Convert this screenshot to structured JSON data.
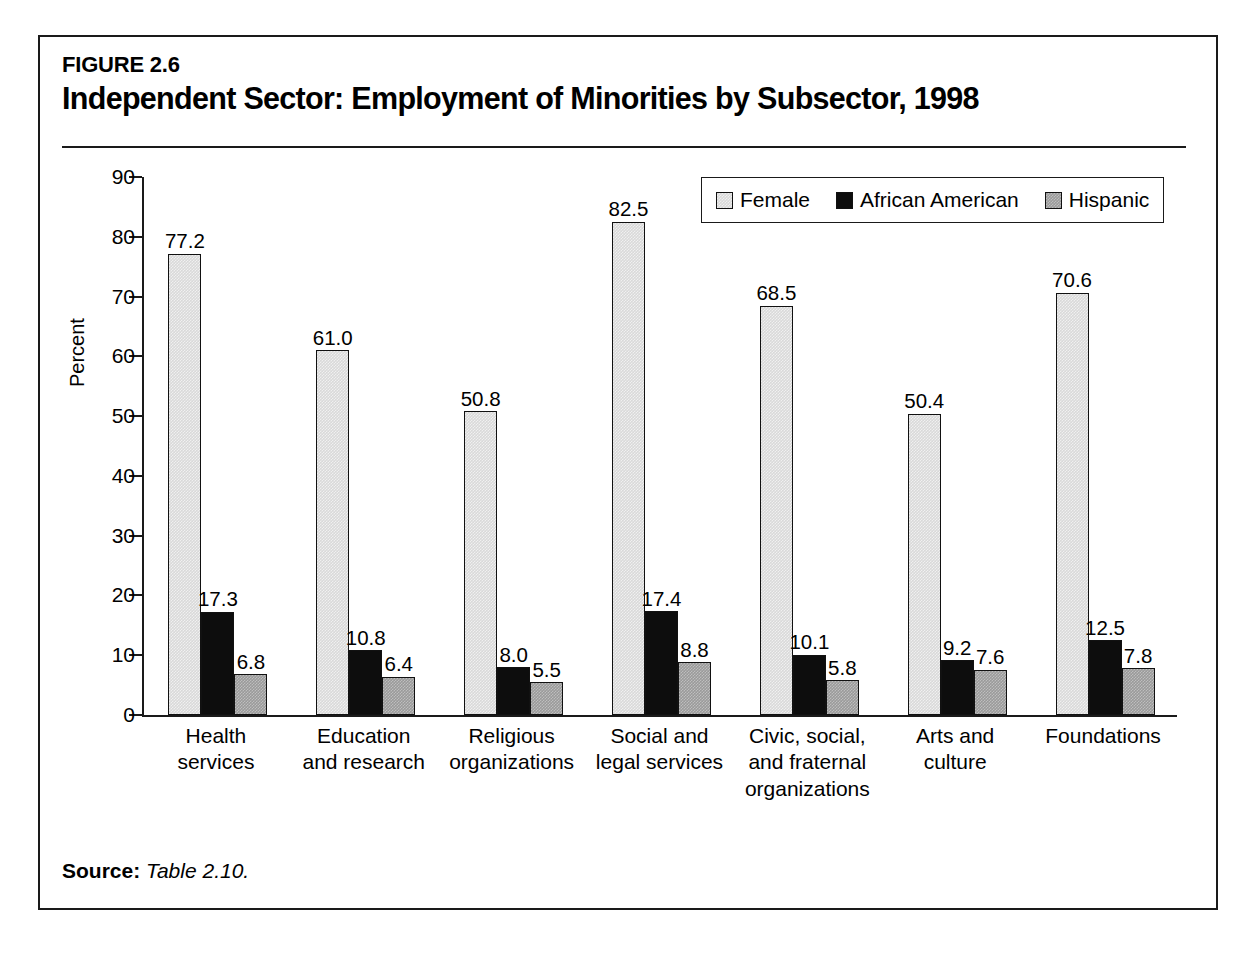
{
  "figure": {
    "number": "FIGURE 2.6",
    "title": "Independent Sector: Employment of Minorities by Subsector, 1998",
    "source_label": "Source:",
    "source_text": "Table 2.10."
  },
  "chart_data": {
    "type": "bar",
    "title": "Independent Sector: Employment of Minorities by Subsector, 1998",
    "xlabel": "",
    "ylabel": "Percent",
    "ylim": [
      0,
      90
    ],
    "yticks": [
      0,
      10,
      20,
      30,
      40,
      50,
      60,
      70,
      80,
      90
    ],
    "ytick_labels": [
      "0",
      "10",
      "20",
      "30",
      "40",
      "50",
      "60",
      "70",
      "80",
      "90"
    ],
    "grid": false,
    "legend_position": "top-right",
    "categories": [
      "Health\nservices",
      "Education\nand research",
      "Religious\norganizations",
      "Social and\nlegal services",
      "Civic, social,\nand fraternal\norganizations",
      "Arts and\nculture",
      "Foundations"
    ],
    "category_lines": [
      [
        "Health",
        "services"
      ],
      [
        "Education",
        "and research"
      ],
      [
        "Religious",
        "organizations"
      ],
      [
        "Social and",
        "legal services"
      ],
      [
        "Civic, social,",
        "and fraternal",
        "organizations"
      ],
      [
        "Arts and",
        "culture"
      ],
      [
        "Foundations"
      ]
    ],
    "series": [
      {
        "name": "Female",
        "color": "#d9d9d9",
        "values": [
          77.2,
          61.0,
          50.8,
          82.5,
          68.5,
          50.4,
          70.6
        ],
        "labels": [
          "77.2",
          "61.0",
          "50.8",
          "82.5",
          "68.5",
          "50.4",
          "70.6"
        ]
      },
      {
        "name": "African American",
        "color": "#0d0d0d",
        "values": [
          17.3,
          10.8,
          8.0,
          17.4,
          10.1,
          9.2,
          12.5
        ],
        "labels": [
          "17.3",
          "10.8",
          "8.0",
          "17.4",
          "10.1",
          "9.2",
          "12.5"
        ]
      },
      {
        "name": "Hispanic",
        "color": "#9a9a9a",
        "values": [
          6.8,
          6.4,
          5.5,
          8.8,
          5.8,
          7.6,
          7.8
        ],
        "labels": [
          "6.8",
          "6.4",
          "5.5",
          "8.8",
          "5.8",
          "7.6",
          "7.8"
        ]
      }
    ]
  }
}
